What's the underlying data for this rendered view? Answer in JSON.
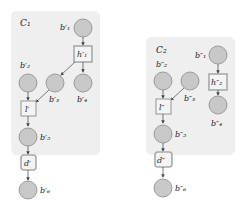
{
  "colors": {
    "panel_bg": "#efefef",
    "node_fill": "#c8c8c8",
    "node_stroke": "#8a8a8a",
    "box_fill": "#f4f4f4",
    "box_stroke": "#8a8a8a",
    "h_box_stroke": "#a9a9a9",
    "arrow": "#444444"
  },
  "panels": [
    {
      "label": "C₁",
      "nodes": {
        "b1": "b′₁",
        "h1": "h′₁",
        "b2": "b′₂",
        "b3": "b′₃",
        "b4": "b′₄",
        "l": "l′",
        "b5": "b′₅",
        "d": "d′",
        "b6": "b′₆"
      }
    },
    {
      "label": "C₂",
      "nodes": {
        "b1": "b″₁",
        "h2": "h″₂",
        "b2": "b″₂",
        "b3": "b″₃",
        "b4": "b″₄",
        "l": "l″",
        "b5": "b″₅",
        "d": "d″",
        "b6": "b″₆"
      }
    }
  ]
}
